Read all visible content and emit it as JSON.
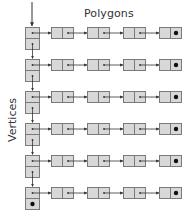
{
  "diagram": {
    "title": "Polygons",
    "side_label": "Vertices",
    "colors": {
      "box_fill": "#d8d8d8",
      "box_stroke": "#7a7a7a",
      "arrow": "#333333",
      "null_dot": "#111111"
    },
    "rows": 6,
    "nodes_per_row": 4,
    "layout": {
      "row_tops": [
        27,
        59,
        91,
        123,
        155,
        187
      ],
      "vertex_x": 25,
      "vertex_w": 14,
      "vertex_cell_h": 11,
      "node_xs": [
        51,
        87,
        123,
        159
      ],
      "node_w": 22,
      "node_h": 11
    },
    "legend": {
      "null_marker": "dot indicates null pointer (end of list)"
    }
  }
}
